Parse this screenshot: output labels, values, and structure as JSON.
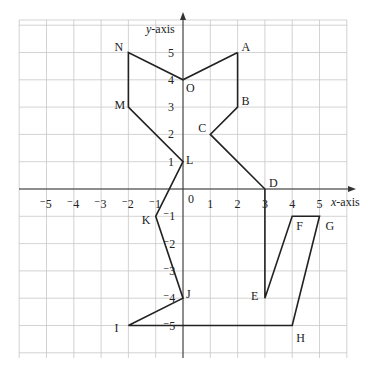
{
  "axes": {
    "x_label_var": "x",
    "x_label_rest": "-axis",
    "y_label_var": "y",
    "y_label_rest": "-axis",
    "origin_label": "0",
    "x_ticks": [
      "-5",
      "-4",
      "-3",
      "-2",
      "-1",
      "1",
      "2",
      "3",
      "4",
      "5"
    ],
    "y_ticks": [
      "5",
      "4",
      "3",
      "2",
      "1",
      "-1",
      "-2",
      "-3",
      "-4",
      "-5"
    ]
  },
  "chart_data": {
    "type": "scatter",
    "title": "",
    "xlabel": "x-axis",
    "ylabel": "y-axis",
    "xlim": [
      -6,
      6
    ],
    "ylim": [
      -6,
      6
    ],
    "grid": true,
    "points": [
      {
        "label": "A",
        "x": 2,
        "y": 5
      },
      {
        "label": "B",
        "x": 2,
        "y": 3
      },
      {
        "label": "C",
        "x": 1,
        "y": 2
      },
      {
        "label": "D",
        "x": 3,
        "y": 0
      },
      {
        "label": "E",
        "x": 3,
        "y": -4
      },
      {
        "label": "F",
        "x": 4,
        "y": -1
      },
      {
        "label": "G",
        "x": 5,
        "y": -1
      },
      {
        "label": "H",
        "x": 4,
        "y": -5
      },
      {
        "label": "I",
        "x": -2,
        "y": -5
      },
      {
        "label": "J",
        "x": 0,
        "y": -4
      },
      {
        "label": "K",
        "x": -1,
        "y": -1
      },
      {
        "label": "L",
        "x": 0,
        "y": 1
      },
      {
        "label": "M",
        "x": -2,
        "y": 3
      },
      {
        "label": "N",
        "x": -2,
        "y": 5
      },
      {
        "label": "O",
        "x": 0,
        "y": 4
      }
    ],
    "path_order": [
      "A",
      "B",
      "C",
      "D",
      "E",
      "F",
      "G",
      "H",
      "I",
      "J",
      "K",
      "L",
      "M",
      "N",
      "O",
      "A"
    ]
  }
}
